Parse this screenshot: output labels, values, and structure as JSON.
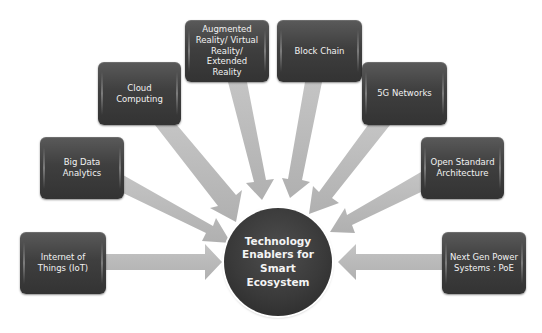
{
  "diagram": {
    "type": "hub-and-spoke",
    "hub": {
      "label": "Technology Enablers for Smart Ecosystem"
    },
    "arrow_color": "#b9b9b9",
    "box_color": "#404040",
    "text_color": "#f2f2f2",
    "nodes": [
      {
        "id": "iot",
        "label": "Internet of Things (IoT)"
      },
      {
        "id": "bigdata",
        "label": "Big Data Analytics"
      },
      {
        "id": "cloud",
        "label": "Cloud Computing"
      },
      {
        "id": "arvr",
        "label": "Augmented Reality/ Virtual Reality/ Extended Reality"
      },
      {
        "id": "blockchain",
        "label": "Block Chain"
      },
      {
        "id": "5g",
        "label": "5G Networks"
      },
      {
        "id": "openstd",
        "label": "Open Standard Architecture"
      },
      {
        "id": "poe",
        "label": "Next Gen Power Systems : PoE"
      }
    ]
  }
}
